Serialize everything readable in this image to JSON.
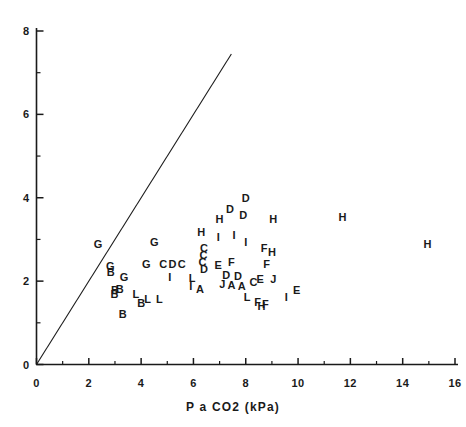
{
  "chart_data": {
    "type": "scatter",
    "title": "",
    "xlabel": "P a CO2 (kPa)",
    "ylabel": "",
    "xlim": [
      0,
      16
    ],
    "ylim": [
      0,
      8
    ],
    "grid": false,
    "legend": "none",
    "marker_style": "letter-coded group labels",
    "xticks": [
      0,
      2,
      4,
      6,
      8,
      10,
      12,
      14,
      16
    ],
    "xtick_labels": [
      "0",
      "2",
      "4",
      "6",
      "8",
      "10",
      "12",
      "14",
      "16"
    ],
    "x_minor_ticks": [
      1,
      3,
      5,
      7,
      9,
      11,
      13,
      15
    ],
    "yticks": [
      0,
      2,
      4,
      6,
      8
    ],
    "ytick_labels": [
      "0",
      "2",
      "4",
      "6",
      "8"
    ],
    "y_minor_ticks": [
      1,
      3,
      5,
      7
    ],
    "reference_line": {
      "label": "line of identity",
      "x": [
        0.0,
        7.45
      ],
      "y": [
        0.0,
        7.45
      ]
    },
    "points": [
      {
        "label": "G",
        "x": 2.35,
        "y": 2.88
      },
      {
        "label": "G",
        "x": 4.5,
        "y": 2.93
      },
      {
        "label": "G",
        "x": 2.82,
        "y": 2.36
      },
      {
        "label": "B",
        "x": 2.84,
        "y": 2.21
      },
      {
        "label": "G",
        "x": 3.35,
        "y": 2.1
      },
      {
        "label": "G",
        "x": 4.2,
        "y": 2.4
      },
      {
        "label": "C",
        "x": 4.85,
        "y": 2.4
      },
      {
        "label": "D",
        "x": 5.2,
        "y": 2.4
      },
      {
        "label": "C",
        "x": 5.55,
        "y": 2.4
      },
      {
        "label": "C",
        "x": 6.4,
        "y": 2.8
      },
      {
        "label": "C",
        "x": 6.38,
        "y": 2.62
      },
      {
        "label": "C",
        "x": 6.35,
        "y": 2.45
      },
      {
        "label": "D",
        "x": 6.4,
        "y": 2.3
      },
      {
        "label": "E",
        "x": 6.95,
        "y": 2.38
      },
      {
        "label": "F",
        "x": 7.45,
        "y": 2.45
      },
      {
        "label": "D",
        "x": 7.25,
        "y": 2.15
      },
      {
        "label": "H",
        "x": 6.3,
        "y": 3.18
      },
      {
        "label": "I",
        "x": 6.95,
        "y": 3.05
      },
      {
        "label": "I",
        "x": 7.55,
        "y": 3.1
      },
      {
        "label": "I",
        "x": 8.0,
        "y": 2.95
      },
      {
        "label": "H",
        "x": 7.0,
        "y": 3.5
      },
      {
        "label": "D",
        "x": 7.4,
        "y": 3.72
      },
      {
        "label": "D",
        "x": 7.9,
        "y": 3.58
      },
      {
        "label": "D",
        "x": 8.0,
        "y": 4.0
      },
      {
        "label": "H",
        "x": 9.05,
        "y": 3.5
      },
      {
        "label": "H",
        "x": 11.7,
        "y": 3.55
      },
      {
        "label": "H",
        "x": 14.95,
        "y": 2.9
      },
      {
        "label": "F",
        "x": 8.7,
        "y": 2.8
      },
      {
        "label": "H",
        "x": 9.0,
        "y": 2.7
      },
      {
        "label": "F",
        "x": 8.8,
        "y": 2.42
      },
      {
        "label": "J",
        "x": 9.05,
        "y": 2.05
      },
      {
        "label": "I",
        "x": 5.1,
        "y": 2.1
      },
      {
        "label": "L",
        "x": 5.95,
        "y": 2.08
      },
      {
        "label": "I",
        "x": 5.9,
        "y": 1.88
      },
      {
        "label": "A",
        "x": 6.25,
        "y": 1.82
      },
      {
        "label": "J",
        "x": 7.1,
        "y": 1.92
      },
      {
        "label": "A",
        "x": 7.45,
        "y": 1.9
      },
      {
        "label": "A",
        "x": 7.85,
        "y": 1.88
      },
      {
        "label": "D",
        "x": 7.7,
        "y": 2.12
      },
      {
        "label": "B",
        "x": 3.0,
        "y": 1.78
      },
      {
        "label": "B",
        "x": 3.18,
        "y": 1.8
      },
      {
        "label": "B",
        "x": 2.98,
        "y": 1.68
      },
      {
        "label": "L",
        "x": 3.8,
        "y": 1.7
      },
      {
        "label": "L",
        "x": 4.25,
        "y": 1.58
      },
      {
        "label": "L",
        "x": 4.7,
        "y": 1.58
      },
      {
        "label": "B",
        "x": 4.0,
        "y": 1.48
      },
      {
        "label": "B",
        "x": 3.3,
        "y": 1.22
      },
      {
        "label": "L",
        "x": 8.05,
        "y": 1.62
      },
      {
        "label": "F",
        "x": 8.45,
        "y": 1.5
      },
      {
        "label": "F",
        "x": 8.75,
        "y": 1.45
      },
      {
        "label": "I",
        "x": 9.55,
        "y": 1.62
      },
      {
        "label": "E",
        "x": 9.95,
        "y": 1.78
      },
      {
        "label": "E",
        "x": 8.55,
        "y": 2.05
      },
      {
        "label": "C",
        "x": 8.3,
        "y": 1.98
      },
      {
        "label": "H",
        "x": 8.6,
        "y": 1.4
      }
    ]
  },
  "axes": {
    "x_title": "P a CO2 (kPa)"
  }
}
